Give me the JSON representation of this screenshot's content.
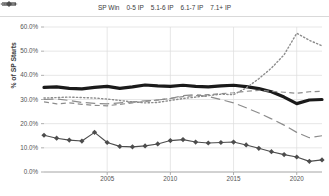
{
  "chart_data": {
    "type": "line",
    "title": "",
    "xlabel": "",
    "ylabel": "% of SP Starts",
    "ylim": [
      0,
      60
    ],
    "ytick_labels": [
      "0.0%",
      "10.0%",
      "20.0%",
      "30.0%",
      "40.0%",
      "50.0%",
      "60.0%"
    ],
    "ytick_values": [
      0,
      10,
      20,
      30,
      40,
      50,
      60
    ],
    "xlim": [
      2000,
      2022
    ],
    "xtick_labels": [
      "2005",
      "2010",
      "2015",
      "2020"
    ],
    "xtick_values": [
      2005,
      2010,
      2015,
      2020
    ],
    "grid": true,
    "legend_position": "top",
    "x": [
      2000,
      2001,
      2002,
      2003,
      2004,
      2005,
      2006,
      2007,
      2008,
      2009,
      2010,
      2011,
      2012,
      2013,
      2014,
      2015,
      2016,
      2017,
      2018,
      2019,
      2020,
      2021,
      2022
    ],
    "series": [
      {
        "name": "SP Win",
        "style": "solid-thick",
        "color": "#1a1a1a",
        "marker": "none",
        "values": [
          35.0,
          35.2,
          34.6,
          34.4,
          35.0,
          35.4,
          34.6,
          35.2,
          36.0,
          35.6,
          35.4,
          35.9,
          35.4,
          35.2,
          35.6,
          35.9,
          35.3,
          34.5,
          33.2,
          31.0,
          28.3,
          29.8,
          30.0
        ]
      },
      {
        "name": "0-5 IP",
        "style": "dotted",
        "color": "#8c8c8c",
        "marker": "none",
        "values": [
          30.6,
          30.8,
          31.0,
          30.8,
          30.6,
          30.2,
          29.6,
          29.0,
          28.6,
          28.8,
          29.6,
          30.4,
          31.0,
          31.6,
          32.2,
          32.0,
          34.8,
          38.6,
          43.0,
          48.5,
          57.4,
          54.5,
          52.2
        ]
      },
      {
        "name": "5.1-6 IP",
        "style": "dashed-medium",
        "color": "#8c8c8c",
        "marker": "none",
        "values": [
          29.0,
          28.2,
          28.6,
          28.0,
          27.6,
          27.4,
          28.0,
          28.6,
          29.2,
          29.8,
          30.4,
          31.2,
          31.6,
          32.0,
          32.4,
          32.8,
          33.4,
          33.8,
          33.4,
          33.0,
          32.6,
          33.2,
          33.4
        ]
      },
      {
        "name": "6.1-7 IP",
        "style": "dashed-long",
        "color": "#8c8c8c",
        "marker": "none",
        "values": [
          30.0,
          30.2,
          29.6,
          28.8,
          28.4,
          28.2,
          28.6,
          29.0,
          29.4,
          29.8,
          30.4,
          31.6,
          32.0,
          31.2,
          30.0,
          28.6,
          26.6,
          24.4,
          22.0,
          19.4,
          16.4,
          14.2,
          15.0
        ]
      },
      {
        "name": "7.1+ IP",
        "style": "solid-thin",
        "color": "#4d4d4d",
        "marker": "diamond",
        "values": [
          15.2,
          14.0,
          13.2,
          12.8,
          16.4,
          12.2,
          10.6,
          10.4,
          10.8,
          11.6,
          13.0,
          13.4,
          12.4,
          12.0,
          12.2,
          12.4,
          11.2,
          9.8,
          8.4,
          7.2,
          6.2,
          4.4,
          5.0
        ]
      }
    ]
  },
  "legend": {
    "items": [
      {
        "label": "SP Win",
        "key": "solid-thick-key"
      },
      {
        "label": "0-5 IP",
        "key": "dotted-key"
      },
      {
        "label": "5.1-6 IP",
        "key": "dashed-medium-key"
      },
      {
        "label": "6.1-7 IP",
        "key": "dashed-long-key"
      },
      {
        "label": "7.1+ IP",
        "key": "diamond-marker-key"
      }
    ]
  },
  "colors": {
    "axis": "#9a9a9a",
    "grid": "#dcdcdc",
    "text": "#555555",
    "sp_win": "#1a1a1a",
    "gray_series": "#8c8c8c",
    "marker_series": "#4d4d4d"
  }
}
